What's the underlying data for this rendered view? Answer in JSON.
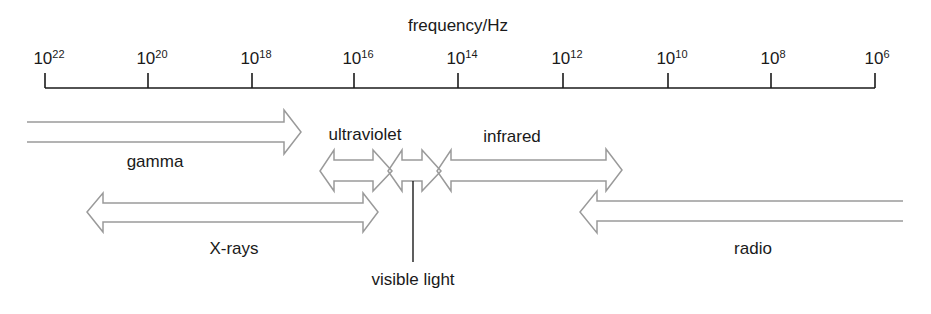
{
  "axis": {
    "title": "frequency/Hz",
    "ticks": [
      {
        "base": "10",
        "exp": "22",
        "x": 45
      },
      {
        "base": "10",
        "exp": "20",
        "x": 148
      },
      {
        "base": "10",
        "exp": "18",
        "x": 252
      },
      {
        "base": "10",
        "exp": "16",
        "x": 354
      },
      {
        "base": "10",
        "exp": "14",
        "x": 458
      },
      {
        "base": "10",
        "exp": "12",
        "x": 563
      },
      {
        "base": "10",
        "exp": "10",
        "x": 668
      },
      {
        "base": "10",
        "exp": "8",
        "x": 771
      },
      {
        "base": "10",
        "exp": "6",
        "x": 875
      }
    ]
  },
  "bands": {
    "gamma": {
      "label": "gamma"
    },
    "xrays": {
      "label": "X-rays"
    },
    "ultraviolet": {
      "label": "ultraviolet"
    },
    "visible": {
      "label": "visible light"
    },
    "infrared": {
      "label": "infrared"
    },
    "radio": {
      "label": "radio"
    }
  },
  "colors": {
    "axis": "#1a1a1a",
    "arrow_stroke": "#9a9a9a",
    "text": "#1a1a1a"
  }
}
